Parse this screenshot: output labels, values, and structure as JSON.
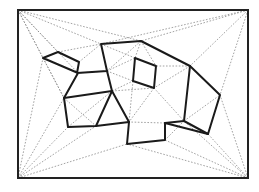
{
  "diagram": {
    "border": {
      "x": 18,
      "y": 10,
      "width": 230,
      "height": 168
    },
    "colors": {
      "solid": "#1a1a1a",
      "dotted": "#8c8c8c",
      "border": "#222222",
      "background": "#ffffff"
    },
    "outer_polygon": [
      [
        43,
        58
      ],
      [
        58,
        52
      ],
      [
        79,
        62
      ],
      [
        77,
        73
      ],
      [
        107,
        71
      ],
      [
        101,
        44
      ],
      [
        141,
        41
      ],
      [
        190,
        66
      ],
      [
        220,
        95
      ],
      [
        208,
        134
      ],
      [
        165,
        123
      ],
      [
        165,
        140
      ],
      [
        127,
        144
      ],
      [
        129,
        122
      ],
      [
        96,
        126
      ],
      [
        68,
        127
      ],
      [
        64,
        98
      ],
      [
        78,
        73
      ]
    ],
    "inner_polygon": [
      [
        135,
        58
      ],
      [
        156,
        66
      ],
      [
        154,
        88
      ],
      [
        133,
        81
      ]
    ],
    "extra_edges": [
      [
        [
          64,
          98
        ],
        [
          112,
          91
        ]
      ],
      [
        [
          112,
          91
        ],
        [
          107,
          71
        ]
      ],
      [
        [
          112,
          91
        ],
        [
          96,
          126
        ]
      ],
      [
        [
          112,
          91
        ],
        [
          129,
          122
        ]
      ],
      [
        [
          190,
          66
        ],
        [
          184,
          121
        ]
      ],
      [
        [
          184,
          121
        ],
        [
          165,
          123
        ]
      ],
      [
        [
          184,
          121
        ],
        [
          208,
          134
        ]
      ]
    ],
    "corner_points": [
      [
        18,
        10
      ],
      [
        248,
        10
      ],
      [
        248,
        178
      ],
      [
        18,
        178
      ]
    ]
  }
}
